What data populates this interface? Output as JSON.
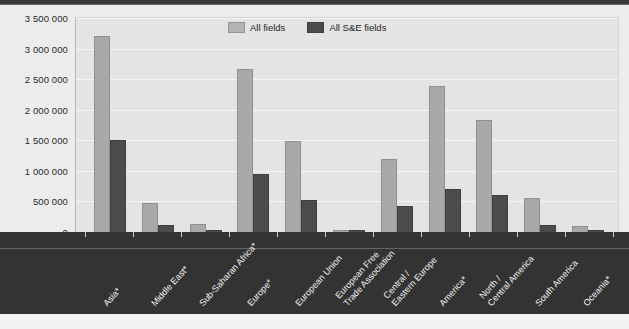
{
  "chart_data": {
    "type": "bar",
    "title": "",
    "xlabel": "",
    "ylabel": "",
    "ylim": [
      0,
      3500000
    ],
    "grid": true,
    "legend_position": "top-center",
    "ytick_labels": [
      "3 500 000",
      "3 000 000",
      "2 500 000",
      "2 000 000",
      "1 500 000",
      "1 000 000",
      "500 000",
      "0"
    ],
    "ytick_values": [
      3500000,
      3000000,
      2500000,
      2000000,
      1500000,
      1000000,
      500000,
      0
    ],
    "categories": [
      "Asia*",
      "Middle East*",
      "Sub-Saharan Africa*",
      "Europe*",
      "European Union",
      "European Free\nTrade Association",
      "Central /\nEastern Europe",
      "America*",
      "North /\nCentral America",
      "South America",
      "Oceania*"
    ],
    "series": [
      {
        "name": "All fields",
        "color": "#a9a9a9",
        "values": [
          3200000,
          470000,
          130000,
          2670000,
          1490000,
          40000,
          1190000,
          2390000,
          1830000,
          560000,
          95000
        ]
      },
      {
        "name": "All S&E fields",
        "color": "#4c4c4c",
        "values": [
          1500000,
          120000,
          30000,
          950000,
          520000,
          12000,
          420000,
          710000,
          600000,
          110000,
          30000
        ]
      }
    ]
  },
  "legend": {
    "items": [
      {
        "label": "All fields",
        "swatch": "all-fields-swatch"
      },
      {
        "label": "All S&E fields",
        "swatch": "all-se-fields-swatch"
      }
    ]
  },
  "footer": {
    "note": ""
  },
  "colors": {
    "all_fields": "#a9a9a9",
    "all_se_fields": "#4c4c4c",
    "band": "#333333",
    "canvas": "#ececec",
    "plot": "#e4e4e4"
  }
}
